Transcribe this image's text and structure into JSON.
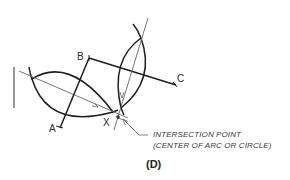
{
  "diagram": {
    "points": {
      "a": "A",
      "b": "B",
      "c": "C",
      "x": "X"
    },
    "annotation": {
      "line1": "INTERSECTION POINT",
      "line2": "(CENTER OF ARC OR CIRCLE)"
    },
    "figure_label": "(D)",
    "colors": {
      "stroke": "#1e1e1e",
      "thin_stroke": "#555555",
      "text": "#2a2a2a"
    }
  }
}
